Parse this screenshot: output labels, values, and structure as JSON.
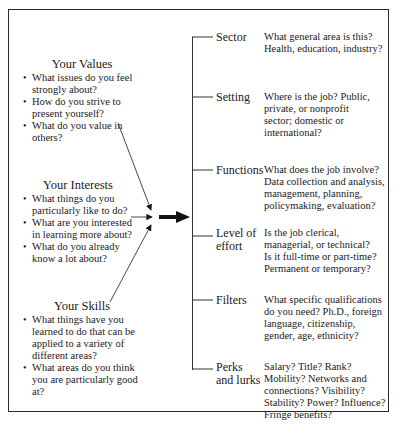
{
  "left_groups": [
    {
      "title": "Your Values",
      "items": [
        "What issues do you feel strongly about?",
        "How do you strive to present yourself?",
        "What do you value in others?"
      ]
    },
    {
      "title": "Your Interests",
      "items": [
        "What things do you particularly like to do?",
        "What are you interested in learning more about?",
        "What do you already know a lot about?"
      ]
    },
    {
      "title": "Your Skills",
      "items": [
        "What things have you learned to do that can be applied to a variety of different areas?",
        "What areas do you think you are particularly good at?"
      ]
    }
  ],
  "right_rows": [
    {
      "label": "Sector",
      "description": "What general area is this? Health, education, industry?"
    },
    {
      "label": "Setting",
      "description": "Where is the job? Public, private, or nonprofit sector; domestic or international?"
    },
    {
      "label": "Functions",
      "description": "What does the job involve? Data collection and analysis, management, planning, policymaking, evaluation?"
    },
    {
      "label": "Level of effort",
      "description": "Is the job clerical, managerial, or technical? Is it full-time or part-time? Permanent or temporary?"
    },
    {
      "label": "Filters",
      "description": "What specific qualifications do you need? Ph.D., foreign language, citizenship, gender, age, ethnicity?"
    },
    {
      "label": "Perks and lurks",
      "description": "Salary? Title? Rank? Mobility? Networks and connections? Visibility? Stability? Power? Influence? Fringe benefits?"
    }
  ]
}
